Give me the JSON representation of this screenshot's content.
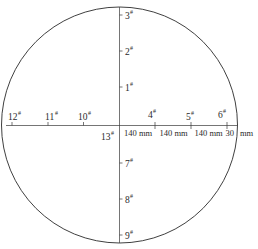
{
  "diagram": {
    "type": "circular-measurement-point-layout",
    "circle": {
      "cx": 119.5,
      "cy": 125,
      "r": 118
    },
    "stroke_color": "#2a2a2a",
    "points_vertical_up": [
      {
        "label": "3",
        "mark": "#",
        "y": 15
      },
      {
        "label": "2",
        "mark": "#",
        "y": 51
      },
      {
        "label": "1",
        "mark": "#",
        "y": 87
      }
    ],
    "points_vertical_down": [
      {
        "label": "7",
        "mark": "#",
        "y": 163
      },
      {
        "label": "8",
        "mark": "#",
        "y": 199
      },
      {
        "label": "9",
        "mark": "#",
        "y": 235
      }
    ],
    "points_horizontal_left": [
      {
        "label": "12",
        "mark": "#",
        "x": 12
      },
      {
        "label": "11",
        "mark": "#",
        "x": 48
      },
      {
        "label": "10",
        "mark": "#",
        "x": 83
      }
    ],
    "points_horizontal_right": [
      {
        "label": "4",
        "mark": "#",
        "x": 155
      },
      {
        "label": "5",
        "mark": "#",
        "x": 191
      },
      {
        "label": "6",
        "mark": "#",
        "x": 227
      }
    ],
    "center_point": {
      "label": "13",
      "mark": "#"
    },
    "dimensions": [
      {
        "text": "140 mm"
      },
      {
        "text": "140 mm"
      },
      {
        "text": "140 mm"
      },
      {
        "text": "30"
      },
      {
        "text": "mm"
      }
    ]
  }
}
